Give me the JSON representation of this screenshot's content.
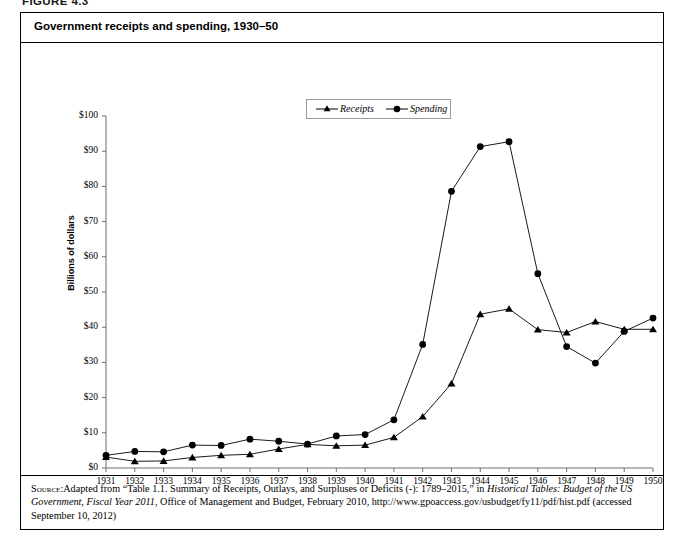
{
  "figure": {
    "number_label": "FIGURE 4.3",
    "title": "Government receipts and spending, 1930–50"
  },
  "legend": {
    "position": "top-center",
    "entries": [
      {
        "label": "Receipts",
        "marker": "triangle-marker",
        "color": "#000000"
      },
      {
        "label": "Spending",
        "marker": "circle-marker",
        "color": "#000000"
      }
    ]
  },
  "axes": {
    "y_title": "Billions of dollars",
    "y_ticks": [
      "$0",
      "$10",
      "$20",
      "$30",
      "$40",
      "$50",
      "$60",
      "$70",
      "$80",
      "$90",
      "$100"
    ],
    "x_ticks": [
      "1931",
      "1932",
      "1933",
      "1934",
      "1935",
      "1936",
      "1937",
      "1938",
      "1939",
      "1940",
      "1941",
      "1942",
      "1943",
      "1944",
      "1945",
      "1946",
      "1947",
      "1948",
      "1949",
      "1950"
    ]
  },
  "source": {
    "label": "Source:",
    "text_1": "Adapted from “Table 1.1. Summary of Receipts, Outlays, and Surpluses or Deficits (-): 1789–2015,” in ",
    "italic_1": "Historical Tables: Budget of the US Government, Fiscal Year 2011",
    "text_2": ", Office of Management and Budget, February 2010, http://www.gpoaccess.gov/usbudget/fy11/pdf/hist.pdf (accessed September 10, 2012)"
  },
  "chart_data": {
    "type": "line",
    "title": "Government receipts and spending, 1930–50",
    "xlabel": "",
    "ylabel": "Billions of dollars",
    "ylim": [
      0,
      100
    ],
    "ytick_step": 10,
    "grid": false,
    "legend_position": "top-center",
    "x": [
      1931,
      1932,
      1933,
      1934,
      1935,
      1936,
      1937,
      1938,
      1939,
      1940,
      1941,
      1942,
      1943,
      1944,
      1945,
      1946,
      1947,
      1948,
      1949,
      1950
    ],
    "series": [
      {
        "name": "Receipts",
        "marker": "triangle",
        "color": "#000000",
        "values": [
          3.1,
          1.9,
          2.0,
          3.0,
          3.6,
          3.9,
          5.4,
          6.7,
          6.3,
          6.5,
          8.7,
          14.6,
          24.0,
          43.7,
          45.2,
          39.3,
          38.5,
          41.6,
          39.4,
          39.4
        ]
      },
      {
        "name": "Spending",
        "marker": "circle",
        "color": "#000000",
        "values": [
          3.6,
          4.7,
          4.6,
          6.5,
          6.4,
          8.2,
          7.6,
          6.8,
          9.1,
          9.5,
          13.7,
          35.1,
          78.6,
          91.3,
          92.7,
          55.2,
          34.5,
          29.8,
          38.8,
          42.6
        ]
      }
    ]
  }
}
